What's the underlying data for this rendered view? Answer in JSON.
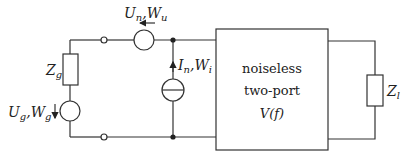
{
  "diagram": {
    "type": "circuit",
    "title": "",
    "components": {
      "source_impedance": {
        "symbol": "Z",
        "sub": "g"
      },
      "generator": {
        "symbol_u": "U",
        "sub_u": "g",
        "symbol_w": "W",
        "sub_w": "g"
      },
      "voltage_noise": {
        "symbol_u": "U",
        "sub_u": "n",
        "symbol_w": "W",
        "sub_w": "u"
      },
      "current_noise": {
        "symbol_i": "I",
        "sub_i": "n",
        "symbol_w": "W",
        "sub_w": "i"
      },
      "two_port": {
        "line1": "noiseless",
        "line2": "two-port",
        "line3": "V(f)"
      },
      "load": {
        "symbol": "Z",
        "sub": "l"
      }
    }
  }
}
